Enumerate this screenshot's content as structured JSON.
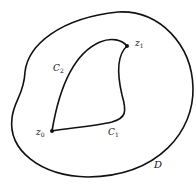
{
  "diagram": {
    "region_label": "D",
    "points": [
      {
        "id": "z0",
        "base": "z",
        "sub": "0"
      },
      {
        "id": "z1",
        "base": "z",
        "sub": "1"
      }
    ],
    "curves": [
      {
        "id": "C1",
        "base": "C",
        "sub": "1"
      },
      {
        "id": "C2",
        "base": "C",
        "sub": "2"
      }
    ],
    "colors": {
      "stroke": "#111111",
      "background": "#ffffff"
    }
  }
}
